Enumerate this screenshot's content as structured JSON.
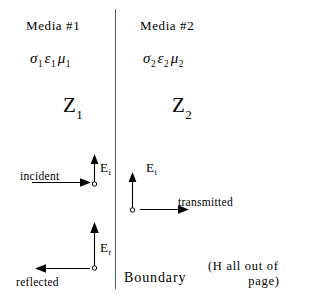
{
  "diagram": {
    "width": 326,
    "height": 297,
    "background": "#ffffff",
    "ink_color": "#000000",
    "line_color": "#5a5a5a"
  },
  "media": [
    {
      "id": "media-1",
      "title": "Media #1",
      "parameters": {
        "conductivity": "σ",
        "conductivity_subscript": "1",
        "permittivity": "ε",
        "permittivity_subscript": "1",
        "permeability": "μ",
        "permeability_subscript": "1"
      },
      "impedance": "Z",
      "impedance_subscript": "1"
    },
    {
      "id": "media-2",
      "title": "Media #2",
      "parameters": {
        "conductivity": "σ",
        "conductivity_subscript": "2",
        "permittivity": "ε",
        "permittivity_subscript": "2",
        "permeability": "μ",
        "permeability_subscript": "2"
      },
      "impedance": "Z",
      "impedance_subscript": "2"
    }
  ],
  "boundary": {
    "label": "Boundary"
  },
  "waves": [
    {
      "id": "incident",
      "label": "incident",
      "field_symbol": "E",
      "field_subscript": "i",
      "field_direction": "up",
      "propagation_direction": "right"
    },
    {
      "id": "reflected",
      "label": "reflected",
      "field_symbol": "E",
      "field_subscript": "r",
      "field_direction": "up",
      "propagation_direction": "left"
    },
    {
      "id": "transmitted",
      "label": "transmitted",
      "field_symbol": "E",
      "field_subscript": "t",
      "field_direction": "up",
      "propagation_direction": "right"
    }
  ],
  "note": {
    "line1": "(H all out of",
    "line2": "page)"
  },
  "icons": {
    "arrow_up": "arrow-up-icon",
    "arrow_right": "arrow-right-icon",
    "arrow_left": "arrow-left-icon",
    "origin_dot": "origin-dot-icon"
  }
}
